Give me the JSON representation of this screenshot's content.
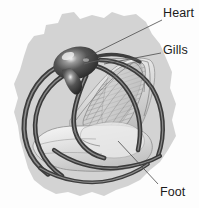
{
  "figure": {
    "type": "anatomical-illustration",
    "background_color": "#fdfdfd",
    "blob_color": "#cfcfcf",
    "body_color": "#d7d7d7",
    "vessel_color": "#4a4a4a",
    "heart_color": "#3a3a3a",
    "gill_color": "#c4c4c4",
    "leader_color": "#4a4a4a",
    "text_color": "#1b1b1b"
  },
  "labels": [
    {
      "id": "heart",
      "text": "Heart",
      "x": 163,
      "y": 7,
      "leader": {
        "x1": 162,
        "y1": 20,
        "x2": 85,
        "y2": 58
      }
    },
    {
      "id": "gills",
      "text": "Gills",
      "x": 163,
      "y": 44,
      "leader": {
        "x1": 161,
        "y1": 53,
        "x2": 104,
        "y2": 64
      }
    },
    {
      "id": "foot",
      "text": "Foot",
      "x": 160,
      "y": 186,
      "leader": {
        "x1": 158,
        "y1": 184,
        "x2": 118,
        "y2": 141
      }
    }
  ]
}
